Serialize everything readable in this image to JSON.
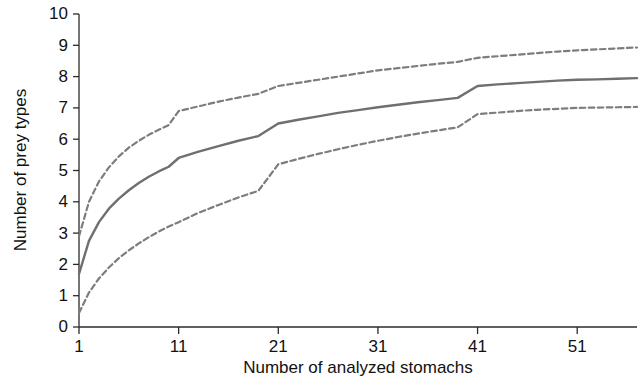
{
  "chart_data": {
    "type": "line",
    "title": "",
    "xlabel": "Number of analyzed stomachs",
    "ylabel": "Number of prey types",
    "xlim": [
      1,
      57
    ],
    "ylim": [
      0,
      10
    ],
    "xticks": [
      1,
      11,
      21,
      31,
      41,
      51
    ],
    "xtick_labels": [
      "1",
      "11",
      "21",
      "31",
      "41",
      "51"
    ],
    "yticks": [
      0,
      1,
      2,
      3,
      4,
      5,
      6,
      7,
      8,
      9,
      10
    ],
    "ytick_labels": [
      "0",
      "1",
      "2",
      "3",
      "4",
      "5",
      "6",
      "7",
      "8",
      "9",
      "10"
    ],
    "grid": false,
    "legend": "none",
    "x": [
      1,
      2,
      3,
      4,
      5,
      6,
      7,
      8,
      9,
      10,
      11,
      13,
      15,
      17,
      19,
      21,
      23,
      25,
      27,
      29,
      31,
      33,
      35,
      37,
      39,
      41,
      43,
      45,
      47,
      49,
      51,
      53,
      55,
      57
    ],
    "series": [
      {
        "name": "upper confidence limit",
        "style": "dashed",
        "color": "#7d7d7d",
        "values": [
          2.9,
          4.0,
          4.65,
          5.1,
          5.45,
          5.73,
          5.95,
          6.14,
          6.3,
          6.45,
          6.9,
          7.05,
          7.2,
          7.33,
          7.45,
          7.7,
          7.8,
          7.9,
          8.0,
          8.1,
          8.2,
          8.27,
          8.34,
          8.41,
          8.47,
          8.6,
          8.65,
          8.7,
          8.75,
          8.8,
          8.84,
          8.87,
          8.9,
          8.93
        ]
      },
      {
        "name": "mean accumulation curve",
        "style": "solid",
        "color": "#6f6f6f",
        "values": [
          1.7,
          2.75,
          3.35,
          3.78,
          4.1,
          4.37,
          4.6,
          4.8,
          4.97,
          5.12,
          5.4,
          5.6,
          5.78,
          5.95,
          6.1,
          6.5,
          6.62,
          6.73,
          6.84,
          6.93,
          7.02,
          7.1,
          7.18,
          7.25,
          7.32,
          7.7,
          7.75,
          7.79,
          7.83,
          7.87,
          7.9,
          7.91,
          7.93,
          7.95
        ]
      },
      {
        "name": "lower confidence limit",
        "style": "dashed",
        "color": "#7d7d7d",
        "values": [
          0.45,
          1.1,
          1.55,
          1.9,
          2.2,
          2.45,
          2.67,
          2.87,
          3.05,
          3.21,
          3.35,
          3.65,
          3.9,
          4.14,
          4.35,
          5.2,
          5.37,
          5.53,
          5.68,
          5.82,
          5.95,
          6.07,
          6.18,
          6.28,
          6.38,
          6.8,
          6.85,
          6.9,
          6.94,
          6.97,
          7.0,
          7.01,
          7.02,
          7.03
        ]
      }
    ]
  },
  "axes": {
    "y_axis_title": "Number of prey types",
    "x_axis_title": "Number of analyzed stomachs"
  }
}
